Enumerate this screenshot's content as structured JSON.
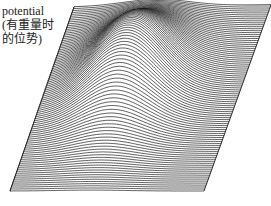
{
  "figure": {
    "label_lines": [
      "potential",
      "(有重量时",
      "的位势)"
    ],
    "type": "3D wireframe surface (hidden-line rendering)",
    "surface": {
      "outline": {
        "top_left": [
          74,
          7
        ],
        "top_right": [
          271,
          5
        ],
        "bottom_right": [
          204,
          191
        ],
        "bottom_left": [
          10,
          191
        ]
      },
      "line_count": 95,
      "line_color": "#1a1a1a",
      "hill": {
        "peak": [
          128,
          46
        ],
        "height_px": 62,
        "sigma_x": 0.17,
        "sigma_y": 0.2,
        "center_u": 0.42,
        "center_v": 0.42
      }
    }
  }
}
